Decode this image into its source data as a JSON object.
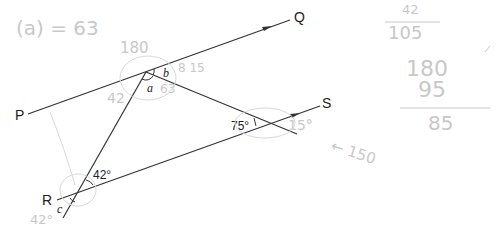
{
  "diagram": {
    "points": {
      "P": "P",
      "Q": "Q",
      "R": "R",
      "S": "S"
    },
    "angles": {
      "a": "a",
      "b": "b",
      "c": "c",
      "angle_R": "42°",
      "angle_right": "75°"
    }
  },
  "annotations": {
    "top_left": "(a) = 63",
    "above_vertex": "180",
    "near_b": "8 15",
    "near_a": "63",
    "left_of_vertex": "42",
    "right_75": "15°",
    "arrow_note": "← 150",
    "below_R": "42°",
    "calc_1": "42",
    "calc_2": "105",
    "calc_3": "180",
    "calc_4": "95",
    "calc_5": "85"
  }
}
